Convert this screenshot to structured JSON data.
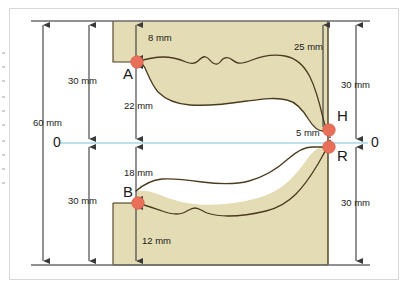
{
  "diagram": {
    "colors": {
      "fill": "#e4dcb4",
      "outline": "#4a3b1e",
      "point_marker": "#e8705a",
      "point_marker_edge": "#d95f49",
      "axis_line": "#a8d4e6",
      "dimension_line": "#3a3a3a",
      "reference_line": "#6b6b6b",
      "frame_border": "#d8d8d8",
      "background": "#ffffff",
      "text": "#1a1a1a"
    },
    "units": "mm",
    "axis": {
      "name": "reference-axis-0",
      "left_label": "0",
      "right_label": "0"
    },
    "points": [
      {
        "id": "A",
        "label": "A"
      },
      {
        "id": "B",
        "label": "B"
      },
      {
        "id": "H",
        "label": "H"
      },
      {
        "id": "R",
        "label": "R"
      }
    ],
    "dimensions": [
      {
        "id": "overall-height",
        "label": "60 mm",
        "value": 60,
        "unit": "mm",
        "orientation": "vertical",
        "side": "left"
      },
      {
        "id": "upper-half-left",
        "label": "30 mm",
        "value": 30,
        "unit": "mm",
        "orientation": "vertical",
        "side": "left"
      },
      {
        "id": "lower-half-left",
        "label": "30 mm",
        "value": 30,
        "unit": "mm",
        "orientation": "vertical",
        "side": "left"
      },
      {
        "id": "top-clearance",
        "label": "8 mm",
        "value": 8,
        "unit": "mm",
        "orientation": "vertical",
        "side": "center"
      },
      {
        "id": "point-a-to-axis",
        "label": "22 mm",
        "value": 22,
        "unit": "mm",
        "orientation": "vertical",
        "side": "center"
      },
      {
        "id": "axis-to-point-b",
        "label": "18 mm",
        "value": 18,
        "unit": "mm",
        "orientation": "vertical",
        "side": "center"
      },
      {
        "id": "point-b-to-bottom",
        "label": "12 mm",
        "value": 12,
        "unit": "mm",
        "orientation": "vertical",
        "side": "center"
      },
      {
        "id": "top-to-point-h",
        "label": "25 mm",
        "value": 25,
        "unit": "mm",
        "orientation": "vertical",
        "side": "right-inner"
      },
      {
        "id": "point-h-to-point-r",
        "label": "5 mm",
        "value": 5,
        "unit": "mm",
        "orientation": "vertical",
        "side": "right-inner"
      },
      {
        "id": "upper-half-right",
        "label": "30 mm",
        "value": 30,
        "unit": "mm",
        "orientation": "vertical",
        "side": "right"
      },
      {
        "id": "lower-half-right",
        "label": "30 mm",
        "value": 30,
        "unit": "mm",
        "orientation": "vertical",
        "side": "right"
      }
    ]
  }
}
